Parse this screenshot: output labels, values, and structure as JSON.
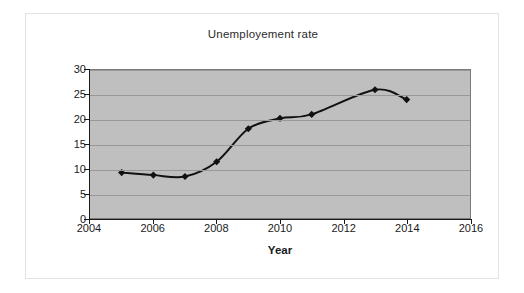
{
  "chart_data": {
    "type": "line",
    "title": "Unemployement rate",
    "xlabel": "Year",
    "ylabel": "Unemployment rate (%)",
    "x": [
      2005,
      2006,
      2007,
      2008,
      2009,
      2010,
      2011,
      2013,
      2014
    ],
    "values": [
      9.2,
      8.7,
      8.4,
      11.4,
      18.1,
      20.2,
      21.0,
      26.0,
      24.0
    ],
    "series": [
      {
        "name": "Unemployment rate",
        "x": [
          2005,
          2006,
          2007,
          2008,
          2009,
          2010,
          2011,
          2013,
          2014
        ],
        "values": [
          9.2,
          8.7,
          8.4,
          11.4,
          18.1,
          20.2,
          21.0,
          26.0,
          24.0
        ]
      }
    ],
    "xlim": [
      2004,
      2016
    ],
    "ylim": [
      0,
      30
    ],
    "xticks": [
      "2004",
      "2006",
      "2008",
      "2010",
      "2012",
      "2014",
      "2016"
    ],
    "xtick_values": [
      2004,
      2006,
      2008,
      2010,
      2012,
      2014,
      2016
    ],
    "yticks": [
      "0",
      "5",
      "10",
      "15",
      "20",
      "25",
      "30"
    ],
    "ytick_values": [
      0,
      5,
      10,
      15,
      20,
      25,
      30
    ],
    "grid": "horizontal",
    "legend": "none",
    "marker": "diamond",
    "plot_background": "#bfbfbf",
    "line_color": "#111111",
    "gridline_color": "#989898",
    "axis_color": "#1a1a1a",
    "figure_background": "#ffffff"
  }
}
